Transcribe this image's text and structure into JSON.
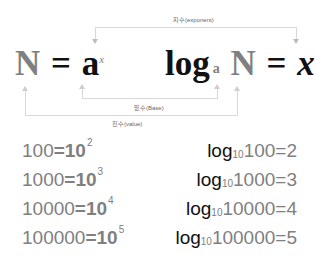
{
  "labels": {
    "exponent": "지수(exponent)",
    "base": "밑수(Base)",
    "value": "진수(value)"
  },
  "equation_left": {
    "N": "N",
    "equals": "=",
    "a": "a",
    "x": "x"
  },
  "equation_right": {
    "log": "log",
    "a": "a",
    "N": "N",
    "equals": "=",
    "x": "x"
  },
  "examples_left": [
    {
      "value": "100",
      "eq": "=10",
      "exp": "2"
    },
    {
      "value": "1000",
      "eq": "=10",
      "exp": "3"
    },
    {
      "value": "10000",
      "eq": "=10",
      "exp": "4"
    },
    {
      "value": "100000",
      "eq": "=10",
      "exp": "5"
    }
  ],
  "examples_right": [
    {
      "log": "log",
      "base": "10",
      "value": "100",
      "eq": "=2"
    },
    {
      "log": "log",
      "base": "10",
      "value": "1000",
      "eq": "=3"
    },
    {
      "log": "log",
      "base": "10",
      "value": "10000",
      "eq": "=4"
    },
    {
      "log": "log",
      "base": "10",
      "value": "100000",
      "eq": "=5"
    }
  ],
  "colors": {
    "gray_text": "#808080",
    "dark_text": "#111111",
    "connector": "#d8d8d8"
  }
}
